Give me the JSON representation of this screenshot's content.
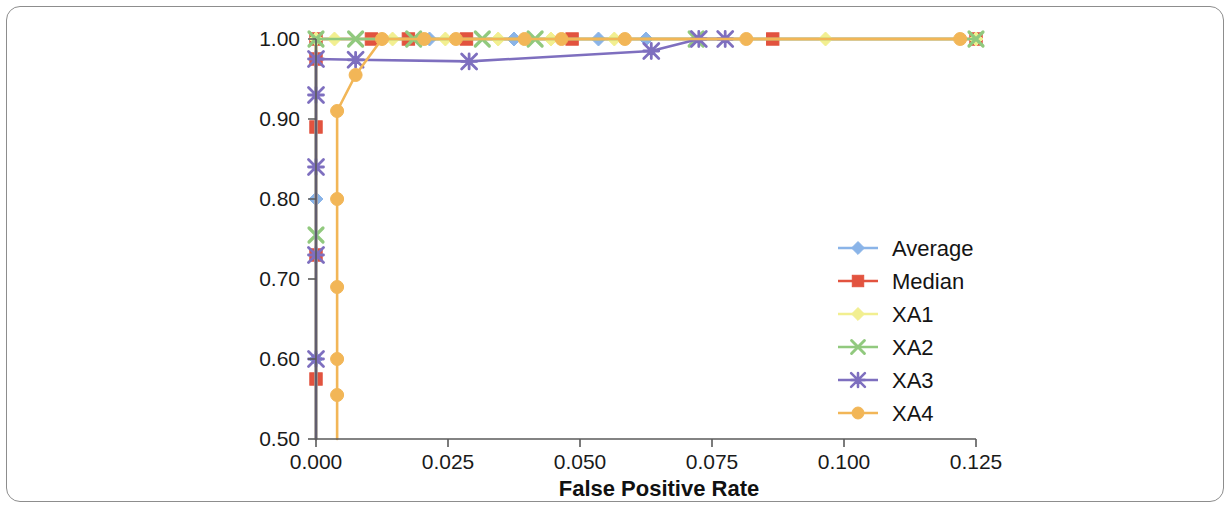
{
  "chart_data": {
    "type": "line",
    "title": "",
    "subtitle": "",
    "xlabel": "False Positive Rate",
    "ylabel": "",
    "xlim": [
      0.0,
      0.125
    ],
    "ylim": [
      0.5,
      1.0
    ],
    "xticks": [
      0.0,
      0.025,
      0.05,
      0.075,
      0.1,
      0.125
    ],
    "xtick_labels": [
      "0.000",
      "0.025",
      "0.050",
      "0.075",
      "0.100",
      "0.125"
    ],
    "yticks": [
      0.5,
      0.6,
      0.7,
      0.8,
      0.9,
      1.0
    ],
    "ytick_labels": [
      "0.50",
      "0.60",
      "0.70",
      "0.80",
      "0.90",
      "1.00"
    ],
    "grid": false,
    "legend_position": "center-right",
    "series": [
      {
        "name": "Average",
        "color": "#8ab4e8",
        "marker": "diamond",
        "points": [
          [
            0.0,
            0.5
          ],
          [
            0.0,
            0.6
          ],
          [
            0.0,
            0.8
          ],
          [
            0.0,
            1.0
          ],
          [
            0.0215,
            1.0
          ],
          [
            0.0375,
            1.0
          ],
          [
            0.0535,
            1.0
          ],
          [
            0.0625,
            1.0
          ],
          [
            0.125,
            1.0
          ]
        ]
      },
      {
        "name": "Median",
        "color": "#e2533f",
        "marker": "square",
        "points": [
          [
            0.0,
            0.5
          ],
          [
            0.0,
            0.575
          ],
          [
            0.0,
            0.73
          ],
          [
            0.0,
            0.89
          ],
          [
            0.0,
            0.975
          ],
          [
            0.0,
            1.0
          ],
          [
            0.0105,
            1.0
          ],
          [
            0.0175,
            1.0
          ],
          [
            0.0285,
            1.0
          ],
          [
            0.0485,
            1.0
          ],
          [
            0.0865,
            1.0
          ],
          [
            0.125,
            1.0
          ]
        ]
      },
      {
        "name": "XA1",
        "color": "#f2ef90",
        "marker": "diamond",
        "points": [
          [
            0.0,
            0.5
          ],
          [
            0.0,
            1.0
          ],
          [
            0.0035,
            1.0
          ],
          [
            0.0145,
            1.0
          ],
          [
            0.0245,
            1.0
          ],
          [
            0.0345,
            1.0
          ],
          [
            0.0445,
            1.0
          ],
          [
            0.0565,
            1.0
          ],
          [
            0.0965,
            1.0
          ],
          [
            0.125,
            1.0
          ]
        ]
      },
      {
        "name": "XA2",
        "color": "#91c97e",
        "marker": "x",
        "points": [
          [
            0.0,
            0.5
          ],
          [
            0.0,
            0.755
          ],
          [
            0.0,
            1.0
          ],
          [
            0.0075,
            1.0
          ],
          [
            0.0185,
            1.0
          ],
          [
            0.0315,
            1.0
          ],
          [
            0.0415,
            1.0
          ],
          [
            0.072,
            1.0
          ],
          [
            0.125,
            1.0
          ]
        ]
      },
      {
        "name": "XA3",
        "color": "#7e6fbf",
        "marker": "asterisk",
        "points": [
          [
            0.0,
            0.5
          ],
          [
            0.0,
            0.6
          ],
          [
            0.0,
            0.73
          ],
          [
            0.0,
            0.84
          ],
          [
            0.0,
            0.93
          ],
          [
            0.0,
            0.975
          ],
          [
            0.0075,
            0.974
          ],
          [
            0.029,
            0.972
          ],
          [
            0.0635,
            0.985
          ],
          [
            0.0725,
            1.0
          ],
          [
            0.0775,
            1.0
          ]
        ]
      },
      {
        "name": "XA4",
        "color": "#f2b657",
        "marker": "circle",
        "points": [
          [
            0.004,
            0.5
          ],
          [
            0.004,
            0.555
          ],
          [
            0.004,
            0.6
          ],
          [
            0.004,
            0.69
          ],
          [
            0.004,
            0.8
          ],
          [
            0.004,
            0.91
          ],
          [
            0.0075,
            0.955
          ],
          [
            0.0125,
            1.0
          ],
          [
            0.0205,
            1.0
          ],
          [
            0.0265,
            1.0
          ],
          [
            0.0395,
            1.0
          ],
          [
            0.0465,
            1.0
          ],
          [
            0.0585,
            1.0
          ],
          [
            0.0815,
            1.0
          ],
          [
            0.122,
            1.0
          ]
        ]
      }
    ]
  },
  "legend": {
    "entries": [
      {
        "label": "Average",
        "color": "#8ab4e8",
        "marker": "diamond"
      },
      {
        "label": "Median",
        "color": "#e2533f",
        "marker": "square"
      },
      {
        "label": "XA1",
        "color": "#f2ef90",
        "marker": "diamond"
      },
      {
        "label": "XA2",
        "color": "#91c97e",
        "marker": "x"
      },
      {
        "label": "XA3",
        "color": "#7e6fbf",
        "marker": "asterisk"
      },
      {
        "label": "XA4",
        "color": "#f2b657",
        "marker": "circle"
      }
    ]
  }
}
